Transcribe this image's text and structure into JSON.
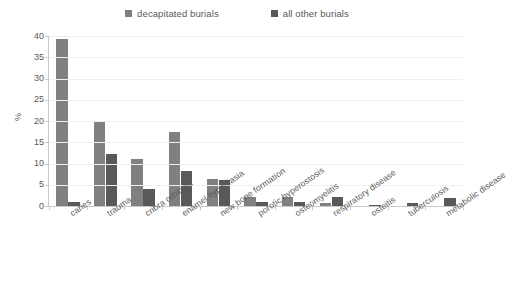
{
  "chart_data": {
    "type": "bar",
    "title": "",
    "xlabel": "",
    "ylabel": "%",
    "ylim": [
      0,
      40
    ],
    "yticks": [
      0,
      5,
      10,
      15,
      20,
      25,
      30,
      35,
      40
    ],
    "grid": true,
    "legend_position": "top-center",
    "categories": [
      "caries",
      "trauma",
      "cribra orbitalia",
      "enamel hypoplasia",
      "new bone formation",
      "porotic hyperostosis",
      "osteomyelitis",
      "respiratory disease",
      "osteitis",
      "tuberculosis",
      "metabolic disease"
    ],
    "series": [
      {
        "name": "decapitated burials",
        "color": "#808080",
        "values": [
          39.3,
          19.8,
          11.0,
          17.5,
          6.3,
          2.2,
          2.2,
          0.6,
          0.0,
          0.0,
          0.0
        ]
      },
      {
        "name": "all other burials",
        "color": "#595959",
        "values": [
          1.0,
          12.2,
          4.0,
          8.3,
          6.1,
          0.9,
          0.9,
          2.1,
          0.3,
          0.7,
          1.9
        ]
      }
    ]
  },
  "legend": {
    "items": [
      {
        "label": "decapitated burials",
        "color": "#808080"
      },
      {
        "label": "all other burials",
        "color": "#595959"
      }
    ]
  },
  "axes": {
    "y_title": "%",
    "y_tick_labels": [
      "40",
      "35",
      "30",
      "25",
      "20",
      "15",
      "10",
      "5",
      "0"
    ]
  }
}
